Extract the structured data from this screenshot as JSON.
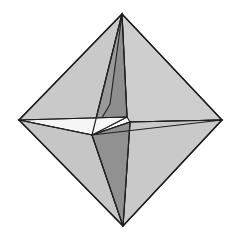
{
  "figure": {
    "background_color": "#FFFFFF",
    "edge_color": "#262626",
    "canvas": {
      "width": 239,
      "height": 241
    },
    "palette": {
      "light_gray": "#C9C9C9",
      "light_gray_alt": "#C3C3C3",
      "pale_gray": "#D2D2D2",
      "mid_gray": "#A8A8A8",
      "dark_gray": "#8E8E8E",
      "darker_gray": "#7C7C7C",
      "near_white": "#F4F4F4",
      "white_face": "#FAFAFA"
    },
    "vertices": {
      "top": [
        122,
        14
      ],
      "right": [
        222,
        120
      ],
      "bottom": [
        123,
        226
      ],
      "left": [
        19,
        120
      ],
      "center": [
        92,
        135
      ],
      "inner_right": [
        130,
        122
      ],
      "inner_upper": [
        127,
        117
      ]
    },
    "faces": [
      {
        "name": "upper-left-large",
        "points": "122,14 19,120 92,135",
        "fill": "#C9C9C9"
      },
      {
        "name": "upper-left-inner-sliver",
        "points": "122,14 92,135 127,117",
        "fill": "#9A9A9A"
      },
      {
        "name": "upper-right-large",
        "points": "122,14 127,117 130,122 222,120",
        "fill": "#CECECE"
      },
      {
        "name": "upper-spine-dark",
        "points": "122,14 110,104 92,135 127,117",
        "fill": "#8E8E8E"
      },
      {
        "name": "left-white-wedge",
        "points": "19,120 92,135 127,117",
        "fill": "#F6F6F6"
      },
      {
        "name": "right-white-wedge",
        "points": "130,122 222,120 92,135",
        "fill": "#F2F2F2"
      },
      {
        "name": "lower-left-large",
        "points": "19,120 92,135 123,226",
        "fill": "#C6C6C6"
      },
      {
        "name": "lower-right-large",
        "points": "130,122 222,120 123,226",
        "fill": "#C9C9C9"
      },
      {
        "name": "lower-spine-dark",
        "points": "92,135 130,122 123,226",
        "fill": "#919191"
      }
    ],
    "interior_edges": [
      {
        "name": "edge-left-to-center",
        "from": [
          19,
          120
        ],
        "to": [
          92,
          135
        ]
      },
      {
        "name": "edge-center-to-inner-right",
        "from": [
          92,
          135
        ],
        "to": [
          130,
          122
        ]
      },
      {
        "name": "edge-inner-right-to-right",
        "from": [
          130,
          122
        ],
        "to": [
          222,
          120
        ]
      },
      {
        "name": "edge-top-to-center",
        "from": [
          122,
          14
        ],
        "to": [
          92,
          135
        ]
      },
      {
        "name": "edge-center-to-bottom",
        "from": [
          92,
          135
        ],
        "to": [
          123,
          226
        ]
      },
      {
        "name": "edge-top-to-inner",
        "from": [
          122,
          14
        ],
        "to": [
          127,
          117
        ]
      },
      {
        "name": "edge-inner-to-bottom",
        "from": [
          130,
          122
        ],
        "to": [
          123,
          226
        ]
      },
      {
        "name": "edge-left-to-inner",
        "from": [
          19,
          120
        ],
        "to": [
          127,
          117
        ]
      },
      {
        "name": "edge-right-to-center",
        "from": [
          222,
          120
        ],
        "to": [
          92,
          135
        ]
      }
    ],
    "silhouette": {
      "name": "outer-diamond-outline",
      "points": "122,14 222,120 123,226 19,120"
    }
  }
}
